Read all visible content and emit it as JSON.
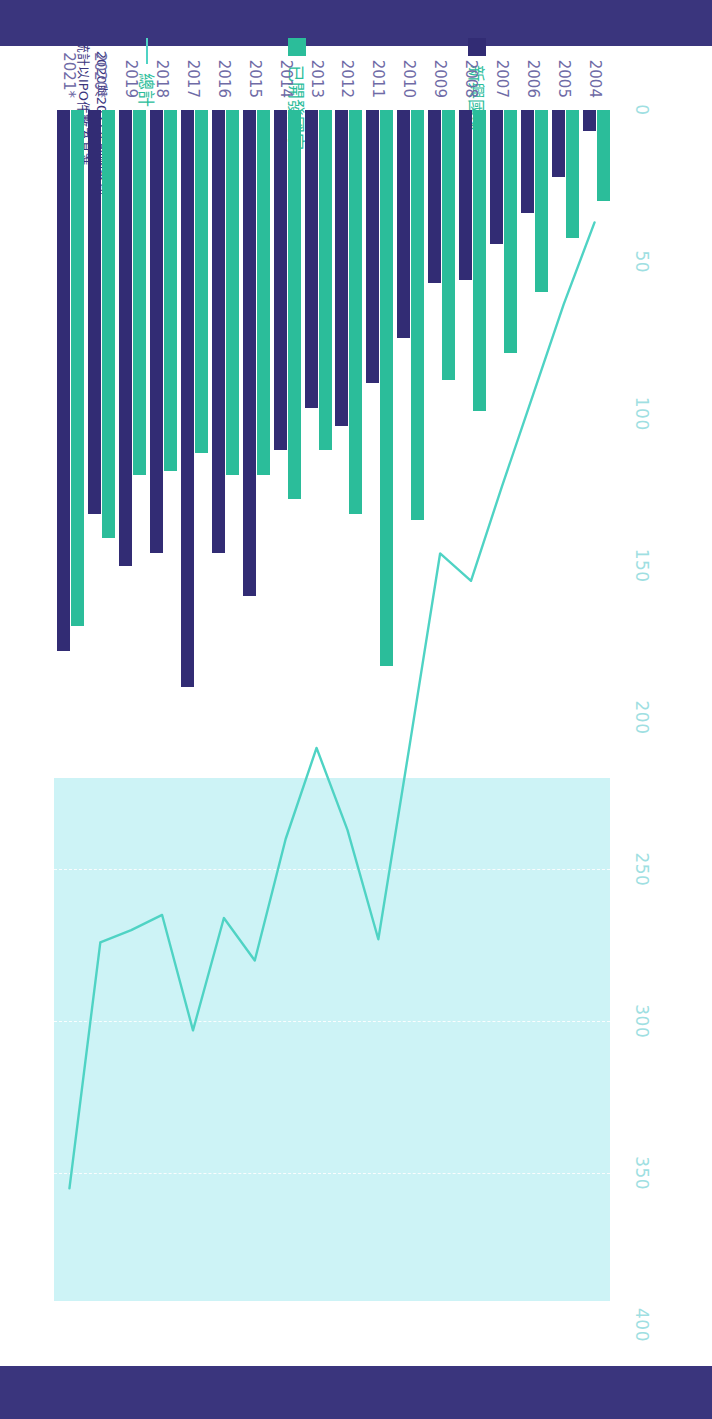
{
  "chart_data": {
    "type": "bar",
    "title": "",
    "subtitle": "",
    "xlabel": "",
    "ylabel": "",
    "orientation": "horizontal",
    "xlim": [
      0,
      400
    ],
    "xticks": [
      0,
      50,
      100,
      150,
      200,
      250,
      300,
      350,
      400
    ],
    "tick_labels": [
      "0",
      "50",
      "100",
      "150",
      "200",
      "250",
      "300",
      "350",
      "400"
    ],
    "grid": true,
    "grid_style": "dashed-white-vertical",
    "shaded_band": {
      "from": 220,
      "to": 392
    },
    "legend_position": "left",
    "categories": [
      "2004",
      "2005",
      "2006",
      "2007",
      "2008",
      "2009",
      "2010",
      "2011",
      "2012",
      "2013",
      "2014",
      "2015",
      "2016",
      "2017",
      "2018",
      "2019",
      "2020*",
      "2021*"
    ],
    "series": [
      {
        "name": "已開發國家",
        "key": "developed",
        "color": "#2bbd9a",
        "type": "bar",
        "values": [
          30,
          42,
          60,
          80,
          99,
          89,
          135,
          183,
          133,
          112,
          128,
          120,
          120,
          113,
          119,
          120,
          141,
          170
        ]
      },
      {
        "name": "新興國家",
        "key": "emerging",
        "color": "#322c74",
        "type": "bar",
        "values": [
          7,
          22,
          34,
          44,
          56,
          57,
          75,
          90,
          104,
          98,
          112,
          160,
          146,
          190,
          146,
          150,
          133,
          178
        ]
      },
      {
        "name": "總計",
        "key": "total",
        "color": "#4fd3c4",
        "type": "line",
        "values": [
          37,
          64,
          94,
          124,
          155,
          146,
          210,
          273,
          237,
          210,
          240,
          280,
          266,
          303,
          265,
          270,
          274,
          355
        ]
      }
    ]
  },
  "legend": {
    "items": [
      {
        "label": "新興國家",
        "marker": "square",
        "color": "#322c74"
      },
      {
        "label": "已開發國家",
        "marker": "square",
        "color": "#2bbd9a"
      },
      {
        "label": "總計",
        "marker": "line",
        "color": "#4fd3c4"
      }
    ]
  },
  "footnote": {
    "line1": "* 2020與2021年的國家別",
    "line2": "統計以IPO件數為基準"
  },
  "colors": {
    "band": "#3a357d",
    "developed": "#2bbd9a",
    "emerging": "#322c74",
    "total_line": "#4fd3c4",
    "shade": "#cdf3f6",
    "tick_text": "#9fdfe2",
    "year_text": "#6f6ba6"
  }
}
